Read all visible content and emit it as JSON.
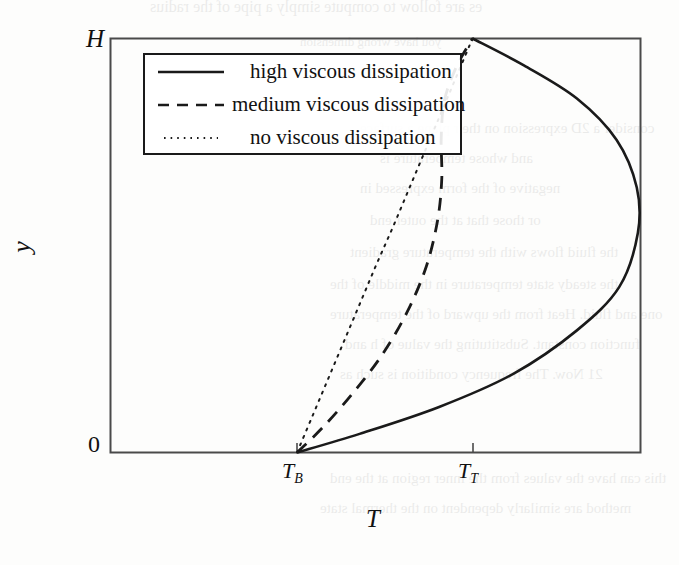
{
  "figure": {
    "type": "line-chart"
  },
  "axes": {
    "y_axis_label": "y",
    "y_axis_top_label": "H",
    "y_axis_bottom_label": "0",
    "x_axis_label": "T",
    "x_tick_labels": [
      {
        "base": "T",
        "sub": "B"
      },
      {
        "base": "T",
        "sub": "T"
      }
    ]
  },
  "legend": {
    "items": [
      {
        "label": "high viscous dissipation",
        "style": "solid",
        "sample": "solid-line-sample"
      },
      {
        "label": "medium viscous dissipation",
        "style": "dashed",
        "sample": "dashed-line-sample"
      },
      {
        "label": "no viscous dissipation",
        "style": "dotted",
        "sample": "dotted-line-sample"
      }
    ]
  },
  "colors": {
    "line": "#1a1a1a",
    "frame": "#444444",
    "background": "#fdfdfc"
  },
  "bleed_text": {
    "note": "illegible reverse-side scanner bleed-through",
    "lines": [
      "es are follow to compute simply a pipe of the radius",
      "you have wrong dimension",
      "consider a 2D expression on the r plane a surface",
      "and whose temperature is",
      "negative of the form expressed in",
      "or those that at the outer end",
      "the fluid flows with the temperature gradient",
      "the steady state temperature in the middle of the",
      "one and fluid. Heat from the upward of the temperature",
      "function constant. Substituting the value of h and",
      "21 Now. The frequency condition is such as",
      "this can have the values from the inner region at the end",
      "method are similarly dependent on the thermal state"
    ]
  },
  "chart_data": {
    "type": "line",
    "title": "",
    "xlabel": "T",
    "ylabel": "y",
    "xlim": [
      0,
      1
    ],
    "ylim": [
      0,
      1
    ],
    "grid": false,
    "legend_position": "upper-left",
    "x_ticks": {
      "positions": [
        0.352,
        0.683
      ],
      "labels": [
        "T_B",
        "T_T"
      ]
    },
    "y_ticks": {
      "positions": [
        0,
        1
      ],
      "labels": [
        "0",
        "H"
      ]
    },
    "series": [
      {
        "name": "high viscous dissipation",
        "style": "solid",
        "x": [
          0.352,
          0.47,
          0.62,
          0.76,
          0.88,
          0.96,
          0.995,
          0.993,
          0.955,
          0.88,
          0.78,
          0.683
        ],
        "y": [
          0.0,
          0.045,
          0.11,
          0.19,
          0.295,
          0.4,
          0.53,
          0.64,
          0.755,
          0.855,
          0.935,
          1.0
        ]
      },
      {
        "name": "medium viscous dissipation",
        "style": "dashed",
        "x": [
          0.352,
          0.4,
          0.455,
          0.512,
          0.56,
          0.596,
          0.617,
          0.625,
          0.624,
          0.63,
          0.652,
          0.683
        ],
        "y": [
          0.0,
          0.06,
          0.14,
          0.235,
          0.34,
          0.45,
          0.56,
          0.66,
          0.76,
          0.85,
          0.93,
          1.0
        ]
      },
      {
        "name": "no viscous dissipation",
        "style": "dotted",
        "x": [
          0.352,
          0.382,
          0.412,
          0.442,
          0.472,
          0.502,
          0.533,
          0.563,
          0.593,
          0.623,
          0.653,
          0.683
        ],
        "y": [
          0.0,
          0.091,
          0.182,
          0.273,
          0.364,
          0.455,
          0.545,
          0.636,
          0.727,
          0.818,
          0.909,
          1.0
        ]
      }
    ]
  }
}
